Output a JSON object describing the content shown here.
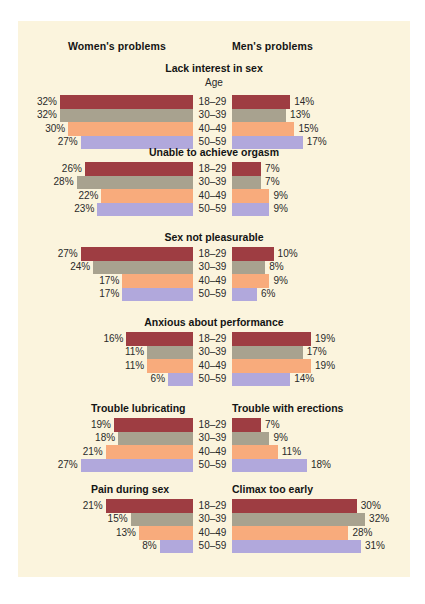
{
  "figure": {
    "panel_color": "#fbf4dd",
    "page_background": "#ffffff",
    "group_headings": {
      "women": "Women's problems",
      "men": "Men's problems"
    },
    "age_header": "Age",
    "age_groups": [
      "18–29",
      "30–39",
      "40–49",
      "50–59"
    ],
    "age_colors": [
      "#9e3d42",
      "#a8a28f",
      "#f8ab7c",
      "#b1a8dc"
    ]
  },
  "chart_data": {
    "type": "bar",
    "subtitle": "",
    "orientation": "horizontal-bidirectional",
    "xlabel": "",
    "ylabel": "Age",
    "value_unit": "%",
    "xlim": [
      0,
      32
    ],
    "grid": false,
    "legend_position": "none",
    "categories": [
      "18–29",
      "30–39",
      "40–49",
      "50–59"
    ],
    "series_groups": [
      "Women's problems",
      "Men's problems"
    ],
    "panels": [
      {
        "id": "lack-interest",
        "title": "Lack interest in sex",
        "title_mode": "shared",
        "left_title": "Lack interest in sex",
        "right_title": "Lack interest in sex",
        "show_age_header": true,
        "women": [
          32,
          32,
          30,
          27
        ],
        "men": [
          14,
          13,
          15,
          17
        ],
        "women_labels": [
          "32%",
          "32%",
          "30%",
          "27%"
        ],
        "men_labels": [
          "14%",
          "13%",
          "15%",
          "17%"
        ]
      },
      {
        "id": "unable-orgasm",
        "title": "Unable to achieve orgasm",
        "title_mode": "shared",
        "left_title": "Unable to achieve orgasm",
        "right_title": "Unable to achieve orgasm",
        "show_age_header": false,
        "women": [
          26,
          28,
          22,
          23
        ],
        "men": [
          7,
          7,
          9,
          9
        ],
        "women_labels": [
          "26%",
          "28%",
          "22%",
          "23%"
        ],
        "men_labels": [
          "7%",
          "7%",
          "9%",
          "9%"
        ]
      },
      {
        "id": "sex-not-pleasurable",
        "title": "Sex not pleasurable",
        "title_mode": "shared",
        "left_title": "Sex not pleasurable",
        "right_title": "Sex not pleasurable",
        "show_age_header": false,
        "women": [
          27,
          24,
          17,
          17
        ],
        "men": [
          10,
          8,
          9,
          6
        ],
        "women_labels": [
          "27%",
          "24%",
          "17%",
          "17%"
        ],
        "men_labels": [
          "10%",
          "8%",
          "9%",
          "6%"
        ]
      },
      {
        "id": "anxious-performance",
        "title": "Anxious about performance",
        "title_mode": "shared",
        "left_title": "Anxious about performance",
        "right_title": "Anxious about performance",
        "show_age_header": false,
        "women": [
          16,
          11,
          11,
          6
        ],
        "men": [
          19,
          17,
          19,
          14
        ],
        "women_labels": [
          "16%",
          "11%",
          "11%",
          "6%"
        ],
        "men_labels": [
          "19%",
          "17%",
          "19%",
          "14%"
        ]
      },
      {
        "id": "lubricating-erections",
        "title": "",
        "title_mode": "split",
        "left_title": "Trouble lubricating",
        "right_title": "Trouble with erections",
        "show_age_header": false,
        "women": [
          19,
          18,
          21,
          27
        ],
        "men": [
          7,
          9,
          11,
          18
        ],
        "women_labels": [
          "19%",
          "18%",
          "21%",
          "27%"
        ],
        "men_labels": [
          "7%",
          "9%",
          "11%",
          "18%"
        ]
      },
      {
        "id": "pain-climax",
        "title": "",
        "title_mode": "split",
        "left_title": "Pain during sex",
        "right_title": "Climax too early",
        "show_age_header": false,
        "women": [
          21,
          15,
          13,
          8
        ],
        "men": [
          30,
          32,
          28,
          31
        ],
        "women_labels": [
          "21%",
          "15%",
          "13%",
          "8%"
        ],
        "men_labels": [
          "30%",
          "32%",
          "28%",
          "31%"
        ]
      }
    ]
  }
}
